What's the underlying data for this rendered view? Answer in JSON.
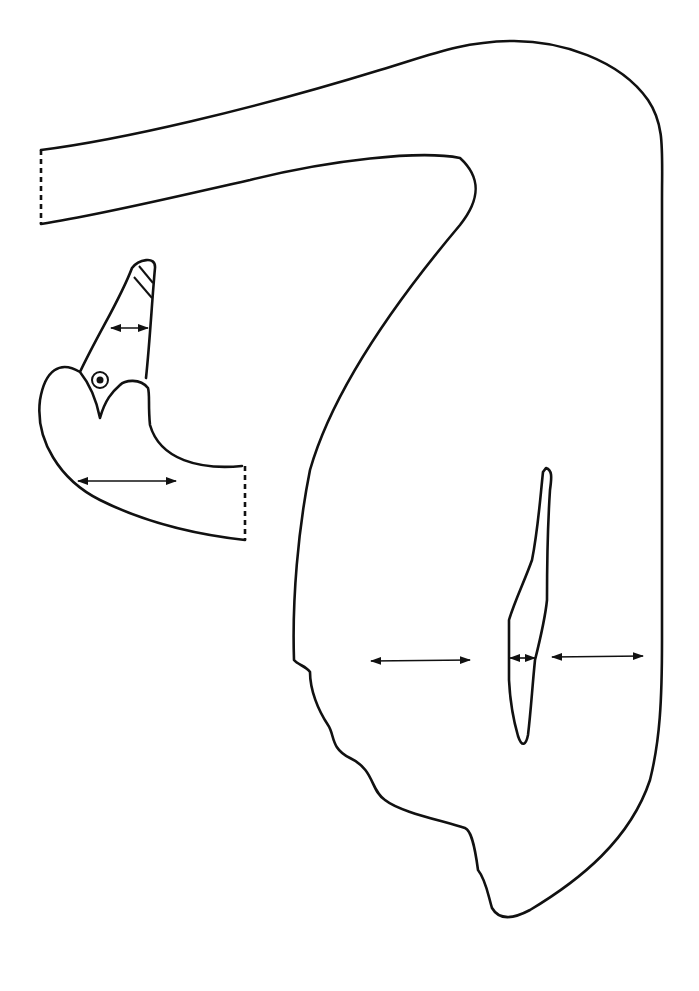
{
  "figure": {
    "type": "sewing-pattern",
    "background": "#ffffff",
    "stroke_color": "#111111",
    "pieces": [
      {
        "name": "body-piece",
        "path": "M 41 150 C 120 140, 250 110, 380 70 C 430 55, 460 42, 510 41 C 560 40, 620 60, 648 100 C 665 125, 662 150, 662 200 L 662 640 C 662 700, 660 740, 650 780 C 630 840, 580 880, 530 910 C 515 918, 500 922, 492 908 C 488 895, 486 880, 478 870 C 474 840, 470 830, 465 828 C 440 820, 400 812, 385 800 C 370 790, 375 770, 350 758 C 330 748, 335 735, 328 725 C 318 710, 310 690, 310 672 C 306 666, 298 665, 294 660 C 292 600, 298 530, 310 470 C 330 400, 380 320, 460 225 C 480 200, 482 178, 460 158 C 420 150, 330 160, 250 180 C 170 198, 100 215, 41 224",
        "dashed_edge": "M 41 150 L 41 224"
      },
      {
        "name": "head-piece",
        "path": "M 242 466 C 200 470, 160 460, 150 425 C 148 405, 150 395, 148 388 C 140 378, 125 380, 120 385 C 112 392, 105 400, 100 418 C 96 398, 88 382, 80 372 C 100 330, 120 300, 132 268 C 138 260, 156 255, 155 268 C 152 300, 150 340, 146 378 M 80 372 C 60 360, 45 370, 40 400 C 35 440, 60 480, 100 500 C 150 525, 200 535, 245 540",
        "dashed_edge": "M 245 466 L 245 540",
        "eye": {
          "cx": 100,
          "cy": 380,
          "r_outer": 8,
          "r_inner": 3.5
        },
        "beak_stripes": [
          "M 139 266 L 153 283",
          "M 134 277 L 152 298"
        ]
      },
      {
        "name": "wing-piece",
        "path": "M 546 468 C 552 470, 552 476, 550 490 C 548 520, 547 560, 547 600 C 545 620, 540 640, 535 660 C 532 690, 531 710, 528 735 C 526 745, 522 748, 518 736 C 512 715, 510 700, 509 680 L 509 620 C 515 600, 525 580, 532 560 C 538 530, 540 500, 543 472 Z"
      }
    ],
    "grain_arrows": [
      {
        "name": "beak-grain-arrow",
        "x1": 111,
        "y1": 328,
        "x2": 148,
        "y2": 328
      },
      {
        "name": "head-grain-arrow",
        "x1": 78,
        "y1": 481,
        "x2": 176,
        "y2": 481
      },
      {
        "name": "body-grain-arrow-left",
        "x1": 371,
        "y1": 661,
        "x2": 470,
        "y2": 660
      },
      {
        "name": "wing-grain-arrow",
        "x1": 510,
        "y1": 658,
        "x2": 535,
        "y2": 658
      },
      {
        "name": "body-grain-arrow-right",
        "x1": 552,
        "y1": 657,
        "x2": 643,
        "y2": 656
      }
    ]
  }
}
